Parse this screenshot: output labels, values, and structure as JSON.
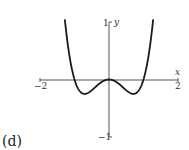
{
  "chart_data": {
    "type": "line",
    "title": "",
    "panel_label": "(d)",
    "xlabel": "x",
    "ylabel": "y",
    "xlim": [
      -2,
      2
    ],
    "ylim": [
      -1,
      1
    ],
    "x_tick_labels": [
      "−2",
      "2"
    ],
    "y_tick_labels": [
      "1",
      "−1"
    ],
    "grid": false,
    "series": [
      {
        "name": "y = x^4 - x^2",
        "function": "x^4 - x^2",
        "x": [
          -1.28,
          -1.2,
          -1.1,
          -1.0,
          -0.9,
          -0.8,
          -0.707,
          -0.6,
          -0.5,
          -0.4,
          -0.3,
          -0.2,
          -0.1,
          0,
          0.1,
          0.2,
          0.3,
          0.4,
          0.5,
          0.6,
          0.707,
          0.8,
          0.9,
          1.0,
          1.1,
          1.2,
          1.28
        ],
        "y": [
          1.04,
          0.634,
          0.254,
          0.0,
          -0.154,
          -0.23,
          -0.25,
          -0.23,
          -0.188,
          -0.134,
          -0.082,
          -0.038,
          -0.0099,
          0,
          -0.0099,
          -0.038,
          -0.082,
          -0.134,
          -0.188,
          -0.23,
          -0.25,
          -0.23,
          -0.154,
          0.0,
          0.254,
          0.634,
          1.04
        ]
      }
    ]
  }
}
